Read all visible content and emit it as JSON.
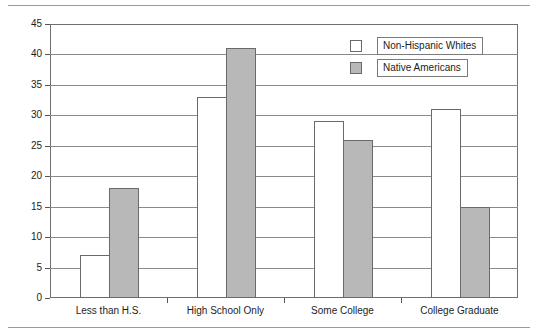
{
  "chart_data": {
    "type": "bar",
    "title": "",
    "subtitle": "",
    "xlabel": "",
    "ylabel": "",
    "categories": [
      "Less than H.S.",
      "High School Only",
      "Some College",
      "College Graduate"
    ],
    "series": [
      {
        "name": "Non-Hispanic Whites",
        "values": [
          7,
          33,
          29,
          31
        ],
        "color": "#ffffff",
        "swatch": "white-square"
      },
      {
        "name": "Native Americans",
        "values": [
          18,
          41,
          26,
          15
        ],
        "color": "#b8b8b8",
        "swatch": "gray-square"
      }
    ],
    "ylim": [
      0,
      45
    ],
    "ytick_step": 5,
    "yticks": [
      0,
      5,
      10,
      15,
      20,
      25,
      30,
      35,
      40,
      45
    ],
    "ytick_labels": [
      "0",
      "5",
      "10",
      "15",
      "20",
      "25",
      "30",
      "35",
      "40",
      "45"
    ],
    "grid": "horizontal",
    "legend_position": "top-right",
    "bar_grouping": "clustered"
  },
  "legend": {
    "entries": [
      {
        "label": "Non-Hispanic Whites"
      },
      {
        "label": "Native Americans"
      }
    ]
  },
  "axes": {
    "y": {
      "labels": [
        "45",
        "40",
        "35",
        "30",
        "25",
        "20",
        "15",
        "10",
        "5",
        "0"
      ]
    },
    "x": {
      "labels": [
        "Less than H.S.",
        "High School Only",
        "Some College",
        "College Graduate"
      ]
    }
  }
}
